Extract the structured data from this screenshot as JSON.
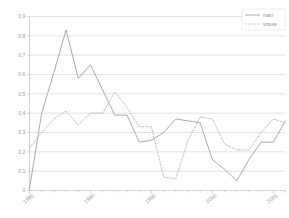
{
  "chart_data": {
    "type": "line",
    "title": "",
    "subtitle": "",
    "xlabel": "",
    "ylabel": "",
    "xlim": [
      1985,
      2006
    ],
    "ylim": [
      0,
      0.9
    ],
    "grid": true,
    "grid_axis": "y",
    "legend_position": "top-right",
    "decimal_separator": ",",
    "x": [
      1985,
      1986,
      1987,
      1988,
      1989,
      1990,
      1991,
      1992,
      1993,
      1994,
      1995,
      1996,
      1997,
      1998,
      1999,
      2000,
      2001,
      2002,
      2003,
      2004,
      2005,
      2006
    ],
    "y_ticks": [
      0,
      0.1,
      0.2,
      0.3,
      0.4,
      0.5,
      0.6,
      0.7,
      0.8,
      0.9
    ],
    "y_tick_labels": [
      "0",
      "0,1",
      "0,2",
      "0,3",
      "0,4",
      "0,5",
      "0,6",
      "0,7",
      "0,8",
      "0,9"
    ],
    "x_ticks": [
      1985,
      1990,
      1995,
      2000,
      2005
    ],
    "x_tick_labels": [
      "1985",
      "1990",
      "1995",
      "2000",
      "2005"
    ],
    "series": [
      {
        "name": "man",
        "style": "solid",
        "color": "#9a9a9a",
        "values": [
          0.01,
          0.4,
          0.61,
          0.83,
          0.58,
          0.65,
          0.52,
          0.39,
          0.39,
          0.25,
          0.26,
          0.3,
          0.37,
          0.36,
          0.35,
          0.16,
          0.11,
          0.05,
          0.16,
          0.25,
          0.25,
          0.36
        ]
      },
      {
        "name": "vrouw",
        "style": "dotted",
        "color": "#b4b4b4",
        "values": [
          0.22,
          0.3,
          0.37,
          0.41,
          0.34,
          0.4,
          0.4,
          0.51,
          0.43,
          0.33,
          0.33,
          0.07,
          0.06,
          0.26,
          0.38,
          0.37,
          0.24,
          0.21,
          0.21,
          0.3,
          0.37,
          0.35
        ]
      }
    ]
  },
  "legend": {
    "entries": [
      {
        "label": "man"
      },
      {
        "label": "vrouw"
      }
    ]
  },
  "axes": {
    "y_labels": [
      "0,9",
      "0,8",
      "0,7",
      "0,6",
      "0,5",
      "0,4",
      "0,3",
      "0,2",
      "0,1",
      "0"
    ],
    "x_labels": [
      "1985",
      "1990",
      "1995",
      "2000",
      "2005"
    ]
  }
}
